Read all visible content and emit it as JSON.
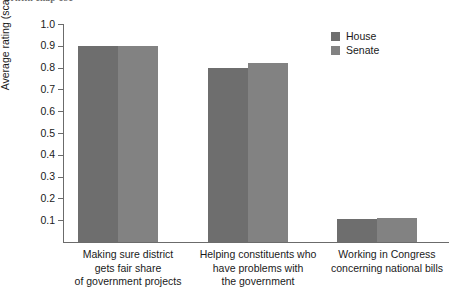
{
  "running_head": "Griffin chap 181",
  "chart_data": {
    "type": "bar",
    "title": "",
    "subtitle": "",
    "xlabel": "",
    "ylabel": "Average rating (scale of 0–1)",
    "ylim": [
      0,
      1.0
    ],
    "ytick_labels": [
      "1.0",
      "0.9",
      "0.8",
      "0.7",
      "0.6",
      "0.5",
      "0.4",
      "0.3",
      "0.2",
      "0.1"
    ],
    "ytick_values": [
      1.0,
      0.9,
      0.8,
      0.7,
      0.6,
      0.5,
      0.4,
      0.3,
      0.2,
      0.1
    ],
    "grid": false,
    "legend_position": "top-right",
    "categories": [
      "Making sure district gets fair share of government projects",
      "Helping constituents who have problems with the government",
      "Working in Congress concerning national bills"
    ],
    "category_label_lines": [
      [
        "Making sure district",
        "gets fair share",
        "of government projects"
      ],
      [
        "Helping constituents who",
        "have problems with",
        "the government"
      ],
      [
        "Working in Congress",
        "concerning national bills"
      ]
    ],
    "series": [
      {
        "name": "House",
        "color": "#6e6e6e",
        "values": [
          0.9,
          0.8,
          0.105
        ]
      },
      {
        "name": "Senate",
        "color": "#828282",
        "values": [
          0.9,
          0.82,
          0.11
        ]
      }
    ]
  },
  "legend": {
    "items": [
      {
        "label": "House",
        "color": "#6e6e6e"
      },
      {
        "label": "Senate",
        "color": "#828282"
      }
    ]
  }
}
